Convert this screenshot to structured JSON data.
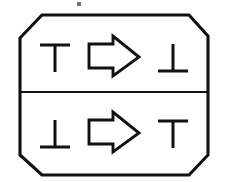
{
  "figure": {
    "title": "Octagonal two-row transformation diagram",
    "background_color": "#ffffff",
    "ink_color": "#111111",
    "width": 228,
    "height": 182,
    "container": {
      "shape": "octagon",
      "name": "octagon-frame",
      "stroke_width": 3.1,
      "points": "42,15 189,15 208,36 208,155 189,175 42,175 20,155 20,38"
    },
    "divider": {
      "name": "row-divider",
      "stroke_width": 2.2,
      "y": 92,
      "x_start": 20,
      "x_end": 208
    },
    "rows": [
      {
        "id": "top-row",
        "label": "top row",
        "left_symbol": {
          "name": "tee-symbol",
          "glyph": "⊤",
          "text": "T",
          "description": "down tack (T shape)",
          "orientation": "bar-on-top"
        },
        "operator": {
          "name": "right-arrow",
          "glyph": "⇨",
          "text": "=>",
          "description": "hollow outlined arrow pointing right",
          "direction": "right"
        },
        "right_symbol": {
          "name": "up-tack-symbol",
          "glyph": "⊥",
          "text": "⊥",
          "description": "up tack (inverted T shape)",
          "orientation": "bar-on-bottom"
        }
      },
      {
        "id": "bottom-row",
        "label": "bottom row",
        "left_symbol": {
          "name": "up-tack-symbol",
          "glyph": "⊥",
          "text": "⊥",
          "description": "up tack (inverted T shape)",
          "orientation": "bar-on-bottom"
        },
        "operator": {
          "name": "right-arrow",
          "glyph": "⇨",
          "text": "=>",
          "description": "hollow outlined arrow pointing right",
          "direction": "right"
        },
        "right_symbol": {
          "name": "tee-symbol",
          "glyph": "⊤",
          "text": "T",
          "description": "down tack (T shape)",
          "orientation": "bar-on-top"
        }
      }
    ],
    "artifact": {
      "name": "scan-speck",
      "description": "small scanning speck above the top edge",
      "x": 78,
      "y": 3
    }
  }
}
